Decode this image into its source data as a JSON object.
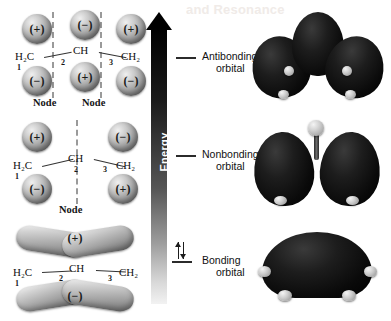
{
  "watermark_text": "and Resonance",
  "energy_axis": {
    "label": "Energy",
    "direction": "up"
  },
  "levels": [
    {
      "id": "antibonding",
      "caption_line1": "Antibonding",
      "caption_line2": "orbital",
      "electrons": 0,
      "electron_glyph": ""
    },
    {
      "id": "nonbonding",
      "caption_line1": "Nonbonding",
      "caption_line2": "orbital",
      "electrons": 0,
      "electron_glyph": ""
    },
    {
      "id": "bonding",
      "caption_line1": "Bonding",
      "caption_line2": "orbital",
      "electrons": 2,
      "electron_glyph": "↑↓"
    }
  ],
  "molecule": {
    "name": "allyl",
    "skeleton_left": "H₂C",
    "skeleton_center": "CH",
    "skeleton_right": "CH₂",
    "carbon_numbers": [
      "1",
      "2",
      "3"
    ]
  },
  "orbitals": [
    {
      "id": "antibonding",
      "node_count": 2,
      "node_label": "Node",
      "node_labels": [
        "Node",
        "Node"
      ],
      "top_signs": [
        "(+)",
        "(−)",
        "(+)"
      ],
      "bottom_signs": [
        "(−)",
        "(+)",
        "(−)"
      ],
      "lobes_present": [
        true,
        true,
        true
      ],
      "style": "discrete-p-orbitals"
    },
    {
      "id": "nonbonding",
      "node_count": 1,
      "node_label": "Node",
      "node_labels": [
        "Node"
      ],
      "top_signs": [
        "(+)",
        "",
        "(−)"
      ],
      "bottom_signs": [
        "(−)",
        "",
        "(+)"
      ],
      "lobes_present": [
        true,
        false,
        true
      ],
      "style": "discrete-p-orbitals"
    },
    {
      "id": "bonding",
      "node_count": 0,
      "node_label": "",
      "node_labels": [],
      "top_signs": [
        "(+)"
      ],
      "bottom_signs": [
        "(−)"
      ],
      "lobes_present": [
        true,
        true,
        true
      ],
      "style": "delocalized-banana"
    }
  ],
  "renderings": [
    {
      "id": "antibonding-3d",
      "description": "three separate lobes",
      "lobe_count": 3
    },
    {
      "id": "nonbonding-3d",
      "description": "two lobes with central atom",
      "lobe_count": 2
    },
    {
      "id": "bonding-3d",
      "description": "one continuous delocalized lobe",
      "lobe_count": 1
    }
  ],
  "colors": {
    "orbital_dark": "#0a0a0a",
    "orbital_light": "#c9c9c9",
    "node_dash": "#9a9a9a",
    "level_line": "#2b2b2b"
  }
}
